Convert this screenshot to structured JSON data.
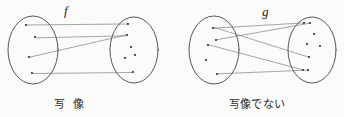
{
  "figure": {
    "width": 344,
    "height": 117,
    "background_color": "#fbfbfa",
    "ink_color": "#3a3a3a",
    "line_color": "#5f5f66",
    "point_color": "#2a2a2a"
  },
  "diagrams": [
    {
      "id": "mapping",
      "label": "f",
      "caption": "写 像",
      "caption_reading": "shazou (mapping)",
      "is_mapping": true,
      "domain_ellipse": {
        "cx": 33,
        "cy": 50,
        "rx": 25,
        "ry": 34
      },
      "codomain_ellipse": {
        "cx": 134,
        "cy": 50,
        "rx": 24,
        "ry": 33
      },
      "domain_points": [
        {
          "x": 26,
          "y": 25
        },
        {
          "x": 35,
          "y": 37
        },
        {
          "x": 29,
          "y": 57
        },
        {
          "x": 32,
          "y": 73
        }
      ],
      "codomain_points": [
        {
          "x": 128,
          "y": 24
        },
        {
          "x": 127,
          "y": 35
        },
        {
          "x": 131,
          "y": 47
        },
        {
          "x": 125,
          "y": 58
        },
        {
          "x": 135,
          "y": 55
        },
        {
          "x": 133,
          "y": 72
        }
      ],
      "arrows": [
        {
          "from": 0,
          "to": 0
        },
        {
          "from": 1,
          "to": 1
        },
        {
          "from": 2,
          "to": 1
        },
        {
          "from": 3,
          "to": 5
        }
      ]
    },
    {
      "id": "not-mapping",
      "label": "g",
      "caption": "写像でない",
      "caption_reading": "shazou de nai (not a mapping)",
      "is_mapping": false,
      "domain_ellipse": {
        "cx": 214,
        "cy": 50,
        "rx": 25,
        "ry": 34
      },
      "codomain_ellipse": {
        "cx": 312,
        "cy": 50,
        "rx": 24,
        "ry": 33
      },
      "domain_points": [
        {
          "x": 213,
          "y": 28
        },
        {
          "x": 216,
          "y": 40
        },
        {
          "x": 208,
          "y": 45
        },
        {
          "x": 206,
          "y": 60
        },
        {
          "x": 217,
          "y": 74
        }
      ],
      "codomain_points": [
        {
          "x": 304,
          "y": 23
        },
        {
          "x": 310,
          "y": 23
        },
        {
          "x": 314,
          "y": 34
        },
        {
          "x": 307,
          "y": 44
        },
        {
          "x": 320,
          "y": 46
        },
        {
          "x": 309,
          "y": 57
        },
        {
          "x": 303,
          "y": 70
        },
        {
          "x": 308,
          "y": 70
        }
      ],
      "arrows": [
        {
          "from": 0,
          "to": 0
        },
        {
          "from": 0,
          "to": 5
        },
        {
          "from": 1,
          "to": 1
        },
        {
          "from": 2,
          "to": 7
        },
        {
          "from": 4,
          "to": 6
        }
      ]
    }
  ]
}
